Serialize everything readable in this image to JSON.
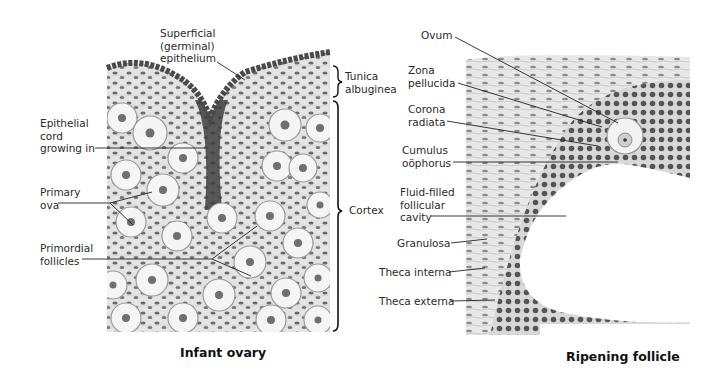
{
  "figures": [
    {
      "id": "infant-ovary",
      "caption": "Infant ovary",
      "labels": {
        "superficial_epithelium": "Superficial\n(germinal)\nepithelium",
        "tunica_albuginea": "Tunica\nalbuginea",
        "epithelial_cord": "Epithelial\ncord\ngrowing in",
        "primary_ova": "Primary\nova",
        "cortex": "Cortex",
        "primordial_follicles": "Primordial\nfollicles"
      }
    },
    {
      "id": "ripening-follicle",
      "caption": "Ripening follicle",
      "labels": {
        "ovum": "Ovum",
        "zona_pellucida": "Zona\npellucida",
        "corona_radiata": "Corona\nradiata",
        "cumulus_oophorus": "Cumulus\noöphorus",
        "follicular_cavity": "Fluid-filled\nfollicular\ncavity",
        "granulosa": "Granulosa",
        "theca_interna": "Theca interna",
        "theca_externa": "Theca externa"
      }
    }
  ],
  "colors": {
    "tissue_bg": "#e6e6e6",
    "nucleus": "#5a5a5a",
    "dark_nucleus": "#3a3a3a",
    "ovum_fill": "#f4f4f4",
    "leader_line": "#222222"
  }
}
